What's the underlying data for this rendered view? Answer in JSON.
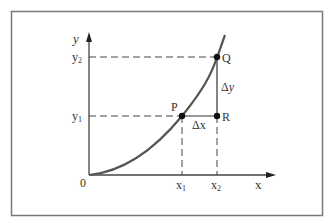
{
  "diagram": {
    "type": "function-increment",
    "colors": {
      "frame": "#7a7a7a",
      "axes": "#444444",
      "curve": "#555555",
      "dashed": "#444444",
      "points": "#111111",
      "text": "#333333"
    },
    "axes": {
      "x_label": "x",
      "y_label": "y",
      "origin_label": "0"
    },
    "ticks": {
      "x1": {
        "base": "x",
        "sub": "1"
      },
      "x2": {
        "base": "x",
        "sub": "2"
      },
      "y1": {
        "base": "y",
        "sub": "1"
      },
      "y2": {
        "base": "y",
        "sub": "2"
      }
    },
    "points": [
      {
        "id": "P",
        "label": "P"
      },
      {
        "id": "Q",
        "label": "Q"
      },
      {
        "id": "R",
        "label": "R"
      }
    ],
    "increments": {
      "dx_label": "Δx",
      "dy_delta": "Δ",
      "dy_var": "y"
    }
  }
}
